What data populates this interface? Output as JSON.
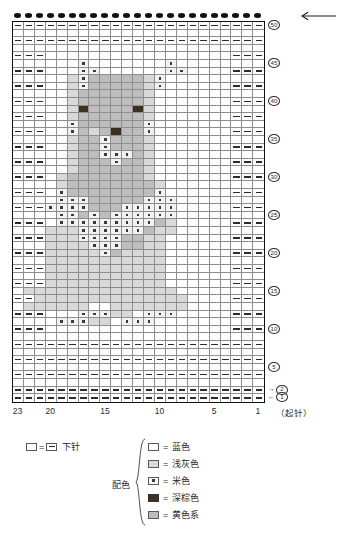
{
  "chart": {
    "columns": 23,
    "rows": 50,
    "top_arrow_icon": "left-arrow-icon",
    "bindoff_marker_icon": "bind-off-dot-icon",
    "row_numbers": [
      {
        "label": "50",
        "row": 50,
        "arrow": ""
      },
      {
        "label": "45",
        "row": 45,
        "arrow": ""
      },
      {
        "label": "40",
        "row": 40,
        "arrow": ""
      },
      {
        "label": "35",
        "row": 35,
        "arrow": ""
      },
      {
        "label": "30",
        "row": 30,
        "arrow": ""
      },
      {
        "label": "25",
        "row": 25,
        "arrow": ""
      },
      {
        "label": "20",
        "row": 20,
        "arrow": ""
      },
      {
        "label": "15",
        "row": 15,
        "arrow": ""
      },
      {
        "label": "10",
        "row": 10,
        "arrow": ""
      },
      {
        "label": "5",
        "row": 5,
        "arrow": ""
      },
      {
        "label": "2",
        "row": 2,
        "arrow": "→"
      },
      {
        "label": "1",
        "row": 1,
        "arrow": "←"
      }
    ],
    "column_numbers": [
      "23",
      "20",
      "15",
      "10",
      "5",
      "1"
    ],
    "column_number_positions": [
      23,
      20,
      15,
      10,
      5,
      1
    ],
    "cast_on_label": "（起针）"
  },
  "legend": {
    "knit": {
      "symbol_left": "empty-square",
      "equals": "=",
      "symbol_right": "dash-square",
      "label": "下针"
    },
    "colors_label": "配色",
    "colors": [
      {
        "swatch": "s-blue",
        "equals": "=",
        "label": "蓝色"
      },
      {
        "swatch": "s-lgray",
        "equals": "=",
        "label": "浅灰色"
      },
      {
        "swatch": "s-beige",
        "equals": "=",
        "label": "米色"
      },
      {
        "swatch": "s-brown",
        "equals": "=",
        "label": "深棕色"
      },
      {
        "swatch": "s-yellow",
        "equals": "=",
        "label": "黄色系"
      }
    ]
  },
  "palette": {
    "blue": "#ffffff",
    "light_gray": "#d9d9d9",
    "beige": "#f2f2f2",
    "dark_brown": "#3a3026",
    "yellow_series": "#bdbdbd",
    "grid_line": "#8e8e8e",
    "border": "#111111"
  },
  "chart_data": {
    "type": "heatmap",
    "title": "",
    "xlabel": "",
    "ylabel": "",
    "legend_position": "bottom",
    "grid": true,
    "codes": {
      "0": "blue",
      "1": "light_gray",
      "2": "beige",
      "3": "dark_brown",
      "4": "yellow_series",
      "k": "knit_dash_overlay"
    },
    "note": "rows listed top (row 50) to bottom (row 1); 23 columns left(col 23) to right(col 1)",
    "rows": [
      {
        "r": 50,
        "cells": "kkkkkkkkkkkkkkkkkkkkkkk"
      },
      {
        "r": 49,
        "cells": "00000000000000000000000"
      },
      {
        "r": 48,
        "cells": "kkkkkkkkkkkkkkkkkkkkkkk"
      },
      {
        "r": 47,
        "cells": "00000000000000000000000"
      },
      {
        "r": 46,
        "cells": "kkk00000000000000000kkk"
      },
      {
        "r": 45,
        "cells": "00000020000000200000000"
      },
      {
        "r": 44,
        "cells": "kkk00022000000220000kkk"
      },
      {
        "r": 43,
        "cells": "00000124444412000000000"
      },
      {
        "r": 42,
        "cells": "kkk00124444412000000kkk"
      },
      {
        "r": 41,
        "cells": "00000144444410000000000"
      },
      {
        "r": 40,
        "cells": "kkk00144444410000000kkk"
      },
      {
        "r": 39,
        "cells": "00000134444310000000000"
      },
      {
        "r": 38,
        "cells": "kkk00144444410000000kkk"
      },
      {
        "r": 37,
        "cells": "00000244444420000000000"
      },
      {
        "r": 36,
        "cells": "kkk00241434420000000kkk"
      },
      {
        "r": 35,
        "cells": "00000144244410000000000"
      },
      {
        "r": 34,
        "cells": "kkk00144244410000000kkk"
      },
      {
        "r": 33,
        "cells": "00000144222410000000000"
      },
      {
        "r": 32,
        "cells": "kkk00144424410000000kkk"
      },
      {
        "r": 31,
        "cells": "00000144444410000000000"
      },
      {
        "r": 30,
        "cells": "kkk01444444410000000kkk"
      },
      {
        "r": 29,
        "cells": "00001444444441000000000"
      },
      {
        "r": 28,
        "cells": "kkk02444444442000000kkk"
      },
      {
        "r": 27,
        "cells": "00002224444422200000000"
      },
      {
        "r": 26,
        "cells": "kkk22224442222200000kkk"
      },
      {
        "r": 25,
        "cells": "00002242422222200000000"
      },
      {
        "r": 24,
        "cells": "kkk02222222224100000kkk"
      },
      {
        "r": 23,
        "cells": "00011122222241100000000"
      },
      {
        "r": 22,
        "cells": "kkk11122224411000000kkk"
      },
      {
        "r": 21,
        "cells": "00011112224411000000000"
      },
      {
        "r": 20,
        "cells": "kkk11111241111000000kkk"
      },
      {
        "r": 19,
        "cells": "00011111111111000000000"
      },
      {
        "r": 18,
        "cells": "kkk11111111111000000kkk"
      },
      {
        "r": 17,
        "cells": "00011111111111000000000"
      },
      {
        "r": 16,
        "cells": "kkk11111111111000000kkk"
      },
      {
        "r": 15,
        "cells": "01111111111111100000000"
      },
      {
        "r": 14,
        "cells": "kk111111111111110000kkk"
      },
      {
        "r": 13,
        "cells": "01111110011111110000000"
      },
      {
        "r": 12,
        "cells": "kkk00022211022200000kkk"
      },
      {
        "r": 11,
        "cells": "00002221102220000000000"
      },
      {
        "r": 10,
        "cells": "kkk00000000000000000kkk"
      },
      {
        "r": 9,
        "cells": "00000000000000000000000"
      },
      {
        "r": 8,
        "cells": "kkkkkkkkkkkkkkkkkkkkkkk"
      },
      {
        "r": 7,
        "cells": "00000000000000000000000"
      },
      {
        "r": 6,
        "cells": "kkkkkkkkkkkkkkkkkkkkkkk"
      },
      {
        "r": 5,
        "cells": "00000000000000000000000"
      },
      {
        "r": 4,
        "cells": "kkkkkkkkkkkkkkkkkkkkkkk"
      },
      {
        "r": 3,
        "cells": "00000000000000000000000"
      },
      {
        "r": 2,
        "cells": "kkkkkkkkkkkkkkkkkkkkkkk"
      },
      {
        "r": 1,
        "cells": "kkkkkkkkkkkkkkkkkkkkkkk"
      }
    ]
  }
}
